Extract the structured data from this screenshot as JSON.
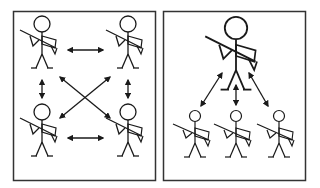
{
  "diagram": {
    "panels": [
      {
        "id": "left",
        "description": "peer-to-peer network of four soldiers",
        "nodes": [
          "soldier-top-left",
          "soldier-top-right",
          "soldier-bottom-left",
          "soldier-bottom-right"
        ],
        "links": [
          [
            "soldier-top-left",
            "soldier-top-right"
          ],
          [
            "soldier-bottom-left",
            "soldier-bottom-right"
          ],
          [
            "soldier-top-left",
            "soldier-bottom-left"
          ],
          [
            "soldier-top-right",
            "soldier-bottom-right"
          ],
          [
            "soldier-top-left",
            "soldier-bottom-right"
          ],
          [
            "soldier-top-right",
            "soldier-bottom-left"
          ]
        ]
      },
      {
        "id": "right",
        "description": "hierarchical network: one leader soldier linked to three subordinate soldiers",
        "nodes": [
          "leader",
          "subordinate-left",
          "subordinate-center",
          "subordinate-right"
        ],
        "links": [
          [
            "leader",
            "subordinate-left"
          ],
          [
            "leader",
            "subordinate-center"
          ],
          [
            "leader",
            "subordinate-right"
          ]
        ]
      }
    ],
    "colors": {
      "stroke": "#1a1a1a",
      "background": "#ffffff",
      "frame": "#333333"
    }
  }
}
